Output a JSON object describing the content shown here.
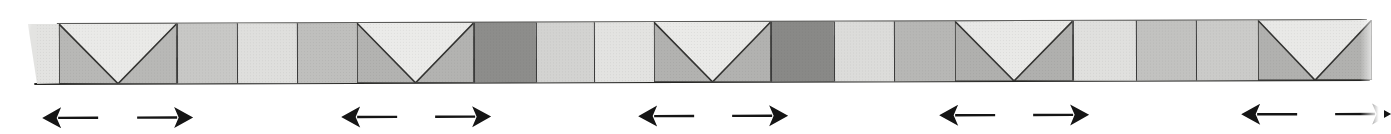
{
  "figure": {
    "kind": "frieze-pattern-strip",
    "background": "#ffffff",
    "outline_color": "#333331",
    "baseline_color": "#262624",
    "arrow_color": "#151515",
    "strip": {
      "top": 22,
      "height": 60,
      "tilt_deg": -0.17,
      "blocks": [
        {
          "type": "edge",
          "x": 20,
          "w": 40,
          "color": "#e3e3e1",
          "slant_top": 8,
          "slant_bottom": 17
        },
        {
          "type": "m",
          "x": 59,
          "w": 118,
          "triangle": "#b8b8b6",
          "field": "#eaeae8"
        },
        {
          "type": "square",
          "x": 177,
          "w": 60,
          "color": "#c8c8c6"
        },
        {
          "type": "square",
          "x": 237,
          "w": 60,
          "color": "#dfdfdd"
        },
        {
          "type": "square",
          "x": 297,
          "w": 60,
          "color": "#bfbfbd"
        },
        {
          "type": "m",
          "x": 357,
          "w": 117,
          "triangle": "#b3b3b1",
          "field": "#ebebe9"
        },
        {
          "type": "square",
          "x": 474,
          "w": 62,
          "color": "#8d8d8b"
        },
        {
          "type": "square",
          "x": 536,
          "w": 58,
          "color": "#d3d3d1"
        },
        {
          "type": "square",
          "x": 594,
          "w": 60,
          "color": "#e3e3e1"
        },
        {
          "type": "m",
          "x": 654,
          "w": 117,
          "triangle": "#b2b2b0",
          "field": "#eaeae8"
        },
        {
          "type": "square",
          "x": 771,
          "w": 63,
          "color": "#898987"
        },
        {
          "type": "square",
          "x": 834,
          "w": 60,
          "color": "#dcdcda"
        },
        {
          "type": "square",
          "x": 894,
          "w": 61,
          "color": "#b7b7b5"
        },
        {
          "type": "m",
          "x": 955,
          "w": 118,
          "triangle": "#b0b0ae",
          "field": "#e9e9e7"
        },
        {
          "type": "square",
          "x": 1073,
          "w": 63,
          "color": "#e0e0de"
        },
        {
          "type": "square",
          "x": 1136,
          "w": 60,
          "color": "#c2c2c0"
        },
        {
          "type": "square",
          "x": 1196,
          "w": 62,
          "color": "#cbcbc9"
        },
        {
          "type": "m",
          "x": 1258,
          "w": 114,
          "triangle": "#b1b1af",
          "field": "#e9e9e7"
        }
      ]
    },
    "arrows": {
      "top": 104,
      "width": 57,
      "height": 24,
      "items": [
        {
          "dir": "left",
          "x": 42
        },
        {
          "dir": "right",
          "x": 136
        },
        {
          "dir": "left",
          "x": 341
        },
        {
          "dir": "right",
          "x": 434
        },
        {
          "dir": "left",
          "x": 638
        },
        {
          "dir": "right",
          "x": 731
        },
        {
          "dir": "left",
          "x": 939
        },
        {
          "dir": "right",
          "x": 1032
        },
        {
          "dir": "left",
          "x": 1241
        },
        {
          "dir": "right",
          "x": 1334
        }
      ]
    }
  }
}
